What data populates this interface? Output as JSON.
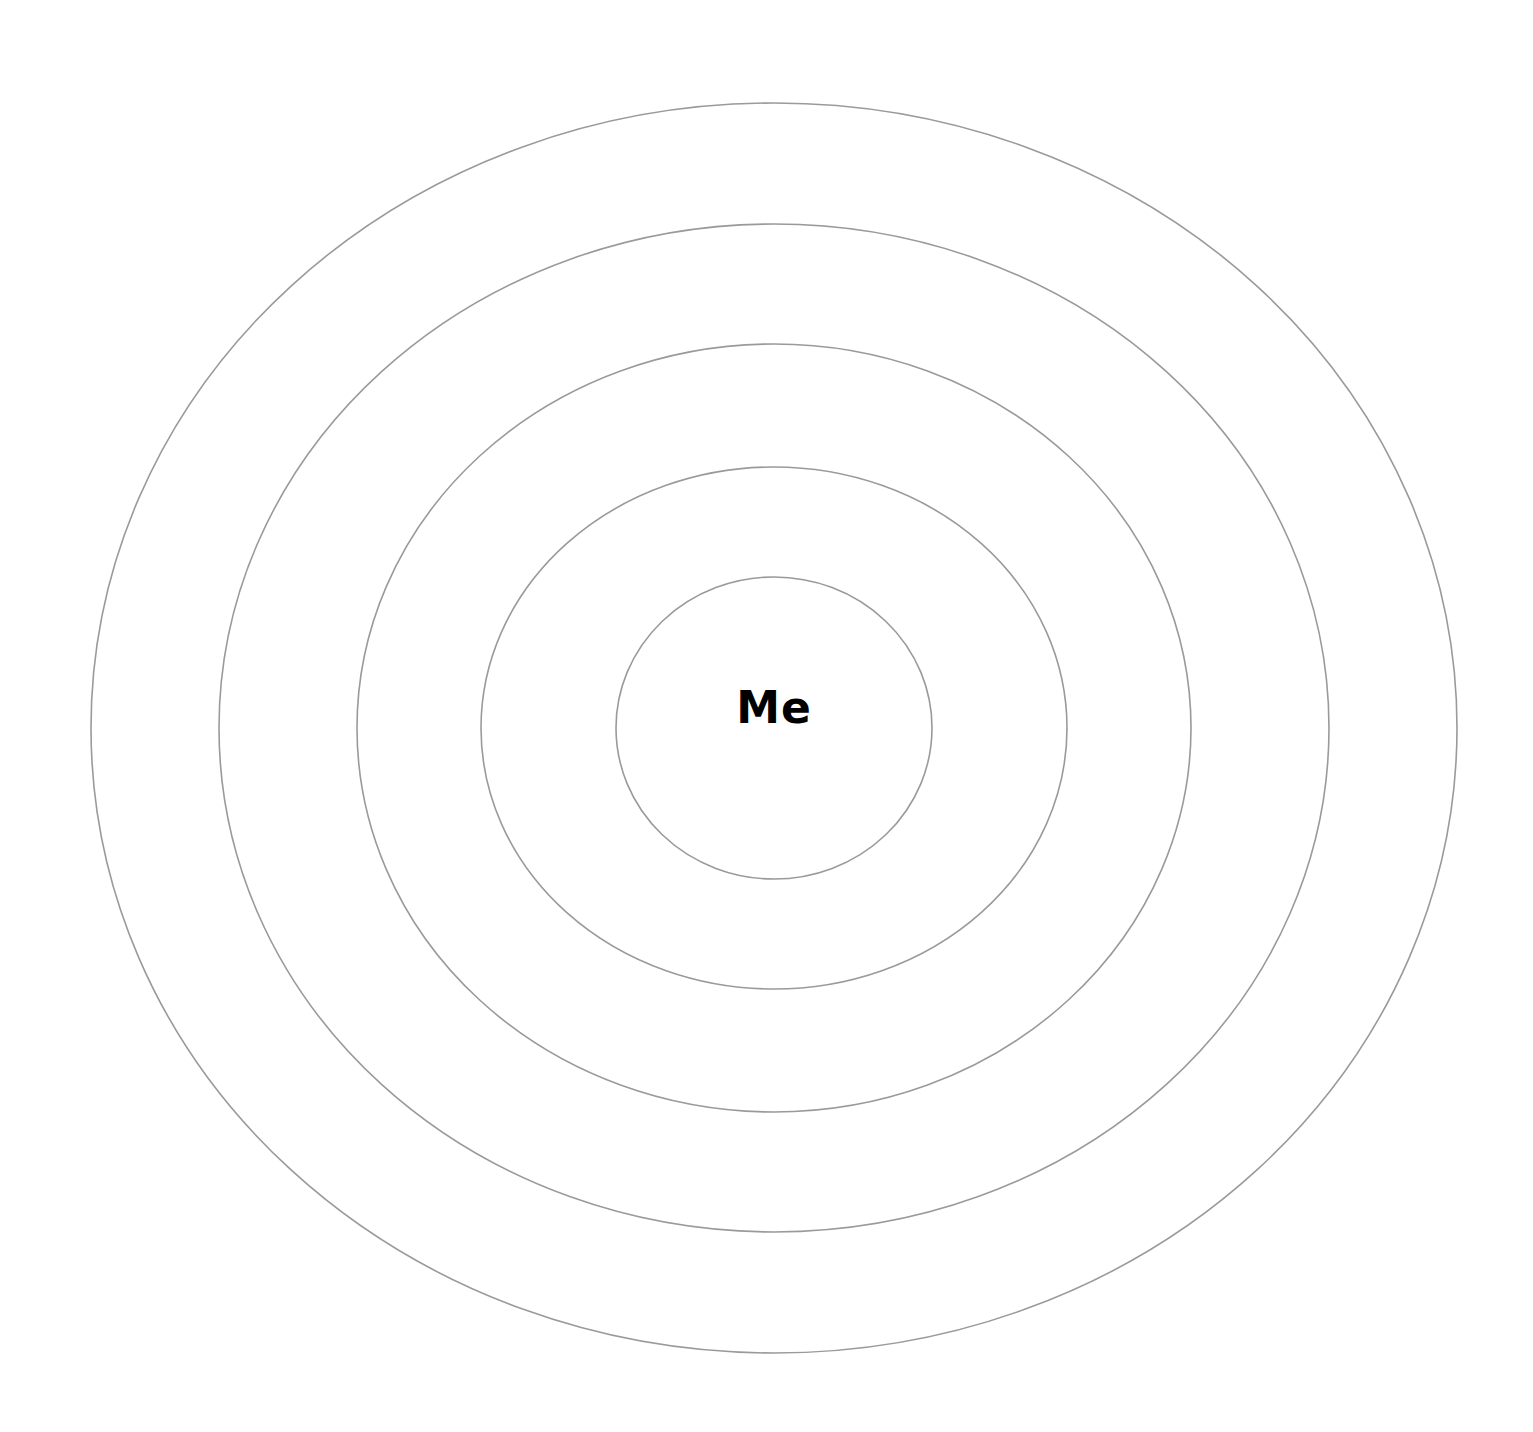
{
  "diagram": {
    "type": "concentric-circles",
    "center_label": "Me",
    "ring_color": "#9a9a9a",
    "label_color": "#000000",
    "background": "#ffffff",
    "center": {
      "cx": 774,
      "cy": 728
    },
    "rings": [
      {
        "name": "ring-1",
        "rx": 158,
        "ry": 151
      },
      {
        "name": "ring-2",
        "rx": 293,
        "ry": 261
      },
      {
        "name": "ring-3",
        "rx": 417,
        "ry": 384
      },
      {
        "name": "ring-4",
        "rx": 555,
        "ry": 504
      },
      {
        "name": "ring-5",
        "rx": 683,
        "ry": 625
      }
    ]
  }
}
